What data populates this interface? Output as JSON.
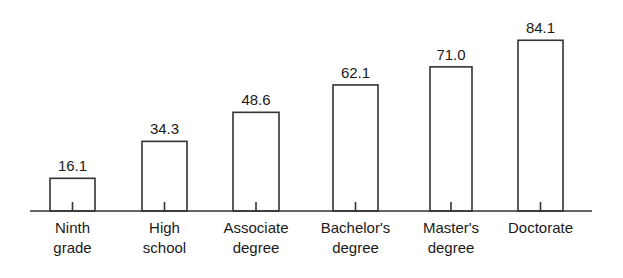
{
  "chart_data": {
    "type": "bar",
    "title": "",
    "subtitle": "",
    "xlabel": "",
    "ylabel": "",
    "ylim": [
      0,
      90
    ],
    "grid": false,
    "legend": null,
    "axis": {
      "x_axis_visible": true,
      "y_axis_visible": false,
      "tick_marks": "one centered tick below each bar"
    },
    "categories": [
      "Ninth grade",
      "High school",
      "Associate degree",
      "Bachelor's degree",
      "Master's degree",
      "Doctorate"
    ],
    "category_lines": [
      [
        "Ninth",
        "grade"
      ],
      [
        "High",
        "school"
      ],
      [
        "Associate",
        "degree"
      ],
      [
        "Bachelor's",
        "degree"
      ],
      [
        "Master's",
        "degree"
      ],
      [
        "Doctorate"
      ]
    ],
    "values": [
      16.1,
      34.3,
      48.6,
      62.1,
      71.0,
      84.1
    ],
    "value_labels": [
      "16.1",
      "34.3",
      "48.6",
      "62.1",
      "71.0",
      "84.1"
    ],
    "bars": [
      {
        "category": "Ninth grade",
        "value": 16.1,
        "label": "16.1",
        "x": 50,
        "width": 45
      },
      {
        "category": "High school",
        "value": 34.3,
        "label": "34.3",
        "x": 142,
        "width": 45
      },
      {
        "category": "Associate degree",
        "value": 48.6,
        "label": "48.6",
        "x": 233,
        "width": 46
      },
      {
        "category": "Bachelor's degree",
        "value": 62.1,
        "label": "62.1",
        "x": 333,
        "width": 45
      },
      {
        "category": "Master's degree",
        "value": 71.0,
        "label": "71.0",
        "x": 430,
        "width": 42
      },
      {
        "category": "Doctorate",
        "value": 84.1,
        "label": "84.1",
        "x": 518,
        "width": 45
      }
    ],
    "geometry": {
      "baseline_y": 211,
      "axis_x_start": 30,
      "axis_x_end": 592,
      "px_per_unit": 2.03,
      "value_label_offset": 7,
      "category_label_line1_y": 233,
      "category_label_line_height": 20
    },
    "colors": {
      "background": "#ffffff",
      "bar_fill": "#ffffff",
      "bar_stroke": "#333333",
      "axis": "#333333",
      "text": "#1a1a1a"
    }
  }
}
